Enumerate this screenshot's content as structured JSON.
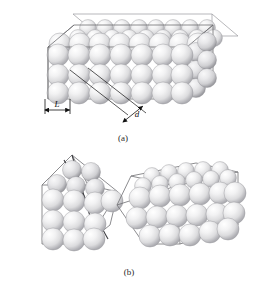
{
  "figure": {
    "background_color": "#ffffff",
    "sphere_color": "#e9e9ea",
    "sphere_highlight": "#ffffff",
    "sphere_shadow": "#a9a9ad",
    "edge_color": "#6e6e72",
    "slip_plane_color": "#3c3c40"
  },
  "panels": [
    {
      "id": "a",
      "caption": "(a)",
      "description": "undeformed single crystal block of close-packed atoms",
      "labels": [
        {
          "name": "L",
          "text": "L",
          "meaning": "interatomic spacing along slip direction"
        },
        {
          "name": "d",
          "text": "d",
          "meaning": "spacing between adjacent slip planes"
        }
      ]
    },
    {
      "id": "b",
      "caption": "(b)",
      "description": "crystal after slip, shown as wedge halves and sheared block",
      "labels": []
    }
  ],
  "captions": {
    "panel_a": "(a)",
    "panel_b": "(b)"
  },
  "dimension_labels": {
    "L": "L",
    "d": "d"
  }
}
